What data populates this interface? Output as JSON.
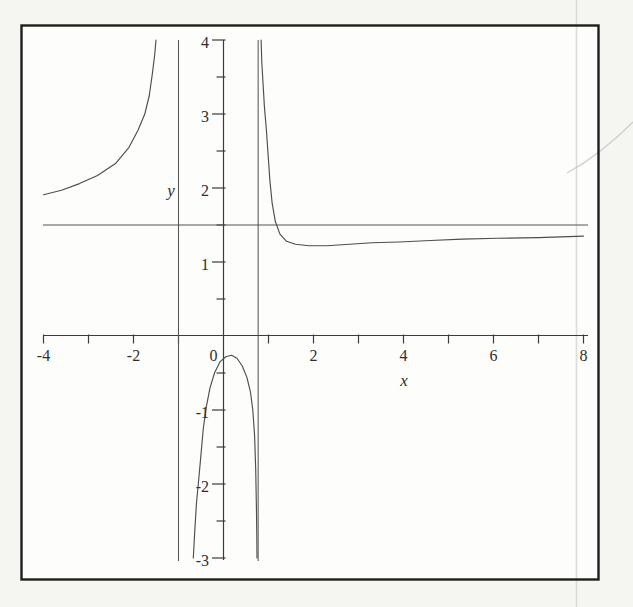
{
  "figure": {
    "kind": "scanned textbook plot of a rational function",
    "visible_text": [
      "-4",
      "-2",
      "0",
      "2",
      "4",
      "6",
      "8",
      "x",
      "4",
      "3",
      "2",
      "1",
      "-1",
      "-2",
      "-3",
      "y"
    ]
  },
  "style": {
    "paper": "#f5f5f2",
    "plot_background": "#fdfdfb",
    "frame_color": "#1e1e1e",
    "ink": "#3c3c3c",
    "curve_color": "#4e4e4e",
    "label_color": "#2f2f2f",
    "artifact_color": "#c9c9c4"
  },
  "axes": {
    "x": {
      "label": "x",
      "labels": [
        {
          "v": -4,
          "t": "-4"
        },
        {
          "v": -2,
          "t": "-2"
        },
        {
          "v": 0,
          "t": "0"
        },
        {
          "v": 2,
          "t": "2"
        },
        {
          "v": 4,
          "t": "4"
        },
        {
          "v": 6,
          "t": "6"
        },
        {
          "v": 8,
          "t": "8"
        }
      ]
    },
    "y": {
      "label": "y",
      "labels": [
        {
          "v": 4,
          "t": "4"
        },
        {
          "v": 3,
          "t": "3"
        },
        {
          "v": 2,
          "t": "2"
        },
        {
          "v": 1,
          "t": "1"
        },
        {
          "v": -1,
          "t": "-1"
        },
        {
          "v": -2,
          "t": "-2"
        },
        {
          "v": -3,
          "t": "-3"
        }
      ]
    }
  },
  "chart_data": {
    "type": "line",
    "title": "",
    "xlabel": "x",
    "ylabel": "y",
    "xlim": [
      -4,
      8
    ],
    "ylim": [
      -3,
      4
    ],
    "x_tick_step": 1,
    "y_tick_step": 0.5,
    "x_labeled_ticks": [
      -4,
      -2,
      0,
      2,
      4,
      6,
      8
    ],
    "y_labeled_ticks": [
      -3,
      -2,
      -1,
      1,
      2,
      3,
      4
    ],
    "grid": false,
    "legend": false,
    "horizontal_asymptote": 1.5,
    "horizontal_line_y": 1.5,
    "vertical_asymptotes": [
      -1,
      0.77
    ],
    "series": [
      {
        "name": "left branch (x < -1)",
        "points": [
          [
            -4,
            1.91
          ],
          [
            -3.6,
            1.97
          ],
          [
            -3.2,
            2.06
          ],
          [
            -2.8,
            2.17
          ],
          [
            -2.4,
            2.33
          ],
          [
            -2.1,
            2.55
          ],
          [
            -1.9,
            2.78
          ],
          [
            -1.75,
            3.0
          ],
          [
            -1.65,
            3.25
          ],
          [
            -1.58,
            3.55
          ],
          [
            -1.53,
            3.8
          ],
          [
            -1.5,
            4.0
          ]
        ]
      },
      {
        "name": "middle branch (-1 < x < 0.77)",
        "points": [
          [
            -0.67,
            -3.0
          ],
          [
            -0.64,
            -2.65
          ],
          [
            -0.6,
            -2.25
          ],
          [
            -0.56,
            -2.0
          ],
          [
            -0.5,
            -1.6
          ],
          [
            -0.45,
            -1.25
          ],
          [
            -0.38,
            -0.95
          ],
          [
            -0.3,
            -0.7
          ],
          [
            -0.2,
            -0.5
          ],
          [
            -0.08,
            -0.35
          ],
          [
            0.05,
            -0.28
          ],
          [
            0.18,
            -0.26
          ],
          [
            0.3,
            -0.3
          ],
          [
            0.42,
            -0.41
          ],
          [
            0.52,
            -0.56
          ],
          [
            0.6,
            -0.76
          ],
          [
            0.65,
            -1.0
          ],
          [
            0.69,
            -1.35
          ],
          [
            0.715,
            -1.8
          ],
          [
            0.73,
            -2.3
          ],
          [
            0.74,
            -2.7
          ],
          [
            0.745,
            -3.0
          ]
        ]
      },
      {
        "name": "right branch (x > 0.77)",
        "points": [
          [
            0.835,
            4.0
          ],
          [
            0.85,
            3.7
          ],
          [
            0.88,
            3.4
          ],
          [
            0.91,
            3.1
          ],
          [
            0.95,
            2.8
          ],
          [
            0.99,
            2.45
          ],
          [
            1.03,
            2.1
          ],
          [
            1.08,
            1.8
          ],
          [
            1.15,
            1.55
          ],
          [
            1.25,
            1.38
          ],
          [
            1.4,
            1.28
          ],
          [
            1.6,
            1.24
          ],
          [
            1.9,
            1.22
          ],
          [
            2.3,
            1.22
          ],
          [
            2.8,
            1.24
          ],
          [
            3.3,
            1.26
          ],
          [
            3.9,
            1.27
          ],
          [
            4.6,
            1.29
          ],
          [
            5.3,
            1.31
          ],
          [
            6.1,
            1.32
          ],
          [
            7.0,
            1.33
          ],
          [
            8.0,
            1.35
          ]
        ]
      }
    ]
  }
}
